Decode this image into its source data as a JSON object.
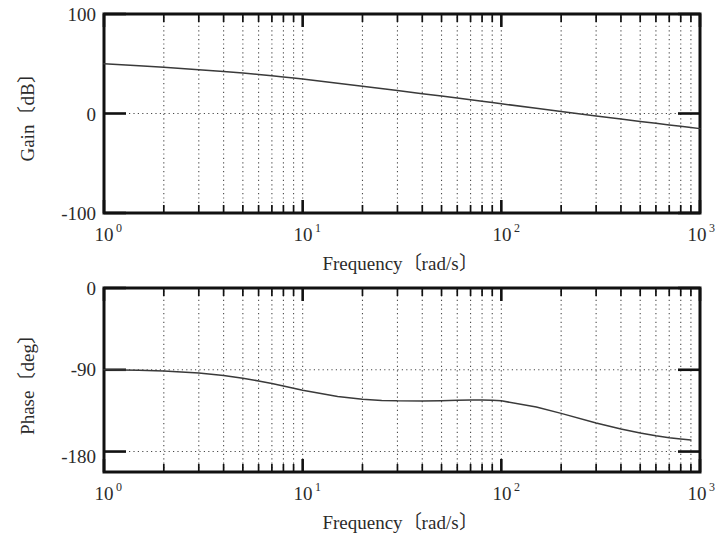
{
  "figure": {
    "type": "bode-plot",
    "background": "#ffffff",
    "curve_color": "#3a3a3a",
    "frame_color": "#111111",
    "grid_color": "#4a4a4a"
  },
  "gain_panel": {
    "y_axis_title": "Gain〔dB〕",
    "y_axis_title_parts": {
      "name": "Gain",
      "open": "〔",
      "unit": "dB",
      "close": "〕"
    },
    "x_axis_title": "Frequency〔rad/s〕",
    "x_axis_title_parts": {
      "name": "Frequency",
      "open": "〔",
      "unit": "rad/s",
      "close": "〕"
    },
    "y_ticks": [
      "100",
      "0",
      "-100"
    ],
    "x_ticks": [
      {
        "base": "10",
        "exp": "0"
      },
      {
        "base": "10",
        "exp": "1"
      },
      {
        "base": "10",
        "exp": "2"
      },
      {
        "base": "10",
        "exp": "3"
      }
    ]
  },
  "phase_panel": {
    "y_axis_title": "Phase〔deg〕",
    "y_axis_title_parts": {
      "name": "Phase",
      "open": "〔",
      "unit": "deg",
      "close": "〕"
    },
    "x_axis_title": "Frequency〔rad/s〕",
    "x_axis_title_parts": {
      "name": "Frequency",
      "open": "〔",
      "unit": "rad/s",
      "close": "〕"
    },
    "y_ticks": [
      "0",
      "-90",
      "-180"
    ],
    "x_ticks": [
      {
        "base": "10",
        "exp": "0"
      },
      {
        "base": "10",
        "exp": "1"
      },
      {
        "base": "10",
        "exp": "2"
      },
      {
        "base": "10",
        "exp": "3"
      }
    ]
  },
  "chart_data": [
    {
      "type": "line",
      "id": "gain",
      "title": "",
      "xlabel": "Frequency〔rad/s〕",
      "ylabel": "Gain〔dB〕",
      "xscale": "log",
      "xlim": [
        1,
        1000
      ],
      "ylim": [
        -100,
        100
      ],
      "ytick_values": [
        100,
        0,
        -100
      ],
      "xtick_values": [
        1,
        10,
        100,
        1000
      ],
      "grid": true,
      "grid_style": "dotted",
      "legend": "none",
      "series": [
        {
          "name": "Gain (dB)",
          "x": [
            1,
            1.5,
            2,
            3,
            4,
            5,
            6,
            7,
            8,
            9,
            10,
            15,
            20,
            30,
            40,
            50,
            60,
            70,
            80,
            90,
            100,
            150,
            200,
            300,
            400,
            500,
            600,
            700,
            800,
            900,
            1000
          ],
          "y": [
            50.0,
            48.0,
            46.4,
            44.0,
            42.2,
            40.6,
            39.2,
            37.9,
            36.8,
            35.7,
            34.6,
            30.4,
            27.3,
            23.0,
            19.9,
            17.5,
            15.5,
            13.8,
            12.3,
            11.0,
            9.8,
            5.2,
            2.0,
            -2.4,
            -5.5,
            -8.0,
            -9.9,
            -11.5,
            -12.9,
            -14.1,
            -15.2
          ]
        }
      ]
    },
    {
      "type": "line",
      "id": "phase",
      "title": "",
      "xlabel": "Frequency〔rad/s〕",
      "ylabel": "Phase〔deg〕",
      "xscale": "log",
      "xlim": [
        1,
        1000
      ],
      "ylim": [
        -180,
        0
      ],
      "ytick_values": [
        0,
        -90,
        -180
      ],
      "xtick_values": [
        1,
        10,
        100,
        1000
      ],
      "grid": true,
      "grid_style": "dotted",
      "legend": "none",
      "series": [
        {
          "name": "Phase (deg)",
          "x": [
            1,
            1.5,
            2,
            3,
            4,
            5,
            6,
            7,
            8,
            9,
            10,
            15,
            20,
            25,
            30,
            40,
            50,
            60,
            70,
            80,
            90,
            100,
            150,
            200,
            300,
            400,
            500,
            600,
            700,
            800,
            900,
            1000
          ],
          "y": [
            -90.0,
            -90.6,
            -91.4,
            -93.5,
            -96.2,
            -99.2,
            -102.3,
            -105.2,
            -107.9,
            -110.3,
            -112.5,
            -119.3,
            -122.4,
            -123.7,
            -124.2,
            -124.3,
            -124.0,
            -123.6,
            -123.3,
            -123.2,
            -123.4,
            -124.2,
            -131.0,
            -138.0,
            -148.5,
            -155.2,
            -159.6,
            -162.6,
            -164.7,
            -166.2,
            -167.3
          ]
        }
      ]
    }
  ]
}
